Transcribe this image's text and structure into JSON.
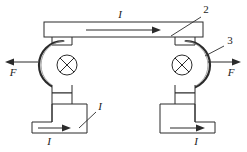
{
  "figure": {
    "canvas": {
      "width": 247,
      "height": 152,
      "background": "#ffffff"
    },
    "stroke_color": "#2b2b2b",
    "fill_color": "#ffffff",
    "line_width": 1
  },
  "labels": {
    "current_top": "I",
    "current_bottom_left_leader": "I",
    "current_bottom_left": "I",
    "current_bottom_right": "I",
    "force_left": "F",
    "force_right": "F",
    "callout_2": "2",
    "callout_3": "3"
  },
  "parts": {
    "top_bar": {
      "name": "top-conductor-bar",
      "x": 44,
      "y": 22,
      "width": 159,
      "height": 15,
      "current_direction": "right"
    },
    "left_arc": {
      "name": "left-coil-arc",
      "center_x": 67,
      "center_y": 65,
      "radius": 24,
      "opens": "left"
    },
    "right_arc": {
      "name": "right-coil-arc",
      "center_x": 182,
      "center_y": 65,
      "radius": 24,
      "opens": "right"
    },
    "left_cross_symbol": {
      "name": "current-into-page-left",
      "center_x": 67,
      "center_y": 65,
      "radius": 10,
      "meaning": "current into page"
    },
    "right_cross_symbol": {
      "name": "current-into-page-right",
      "center_x": 182,
      "center_y": 65,
      "radius": 10,
      "meaning": "current into page"
    },
    "left_force_arrow": {
      "name": "force-arrow-left",
      "from_x": 38,
      "to_x": 8,
      "y": 62,
      "direction": "left"
    },
    "right_force_arrow": {
      "name": "force-arrow-right",
      "from_x": 208,
      "to_x": 238,
      "y": 62,
      "direction": "right"
    },
    "bottom_left_conductor": {
      "name": "bottom-left-stepped-conductor",
      "current_direction": "right"
    },
    "bottom_right_conductor": {
      "name": "bottom-right-stepped-conductor",
      "current_direction": "right"
    }
  },
  "callout_lines": {
    "leader_2": {
      "from_x": 200,
      "from_y": 18,
      "to_x": 172,
      "to_y": 36
    },
    "leader_3": {
      "from_x": 224,
      "from_y": 46,
      "to_x": 204,
      "to_y": 55
    },
    "leader_I_bottom_left": {
      "from_x": 95,
      "from_y": 112,
      "to_x": 79,
      "to_y": 128
    }
  }
}
